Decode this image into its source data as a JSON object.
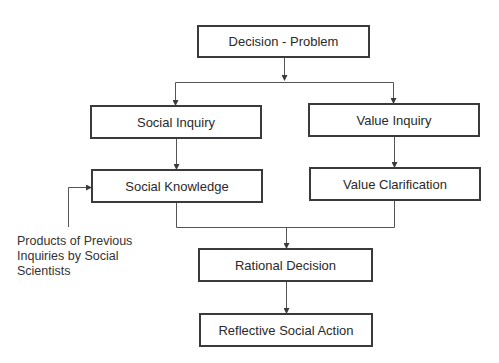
{
  "diagram": {
    "nodes": {
      "decision_problem": "Decision - Problem",
      "social_inquiry": "Social Inquiry",
      "value_inquiry": "Value Inquiry",
      "social_knowledge": "Social Knowledge",
      "value_clarification": "Value Clarification",
      "rational_decision": "Rational Decision",
      "reflective_social_action": "Reflective Social Action"
    },
    "side_note": {
      "lines": [
        "Products of Previous",
        "Inquiries by Social",
        "Scientists"
      ]
    },
    "edges": [
      {
        "from": "Decision - Problem",
        "to": "Social Inquiry"
      },
      {
        "from": "Decision - Problem",
        "to": "Value Inquiry"
      },
      {
        "from": "Social Inquiry",
        "to": "Social Knowledge"
      },
      {
        "from": "Value Inquiry",
        "to": "Value Clarification"
      },
      {
        "from": "Products of Previous Inquiries by Social Scientists",
        "to": "Social Knowledge"
      },
      {
        "from": "Social Knowledge",
        "to": "Rational Decision"
      },
      {
        "from": "Value Clarification",
        "to": "Rational Decision"
      },
      {
        "from": "Rational Decision",
        "to": "Reflective Social Action"
      }
    ],
    "colors": {
      "line": "#3a3a3a",
      "text": "#2a2a2a",
      "background": "#ffffff"
    }
  }
}
